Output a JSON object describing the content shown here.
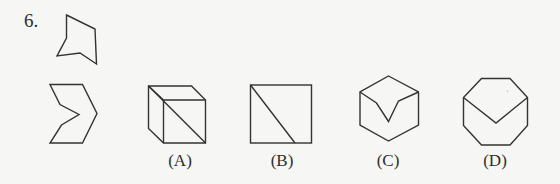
{
  "question": {
    "number": "6.",
    "stem_shapes": [
      "concave-pentagon-piece",
      "chevron-hexagon-piece"
    ],
    "options": [
      {
        "label": "(A)",
        "figure": "cube-with-face-diagonal"
      },
      {
        "label": "(B)",
        "figure": "square-with-diagonal-line"
      },
      {
        "label": "(C)",
        "figure": "hexagon-with-v-notch"
      },
      {
        "label": "(D)",
        "figure": "octagon-with-v-line"
      }
    ]
  },
  "colors": {
    "background": "#f6f6f4",
    "line": "#333333",
    "text": "#2e2e2e"
  }
}
